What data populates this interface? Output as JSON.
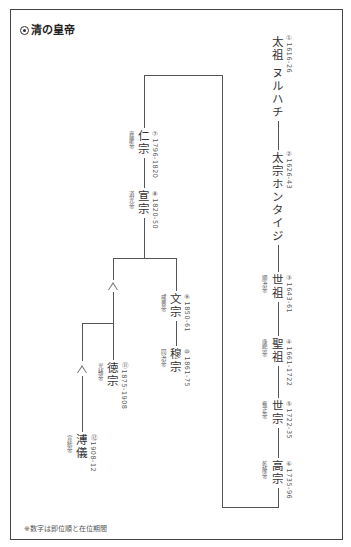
{
  "title": "清の皇帝",
  "note": "※数字は即位順と在位期間",
  "emperors": [
    {
      "order": "①",
      "name": "太祖 ヌルハチ",
      "reign": "1616-26",
      "era": ""
    },
    {
      "order": "②",
      "name": "太宗ホンタイジ",
      "reign": "1626-43",
      "era": ""
    },
    {
      "order": "③",
      "name": "世祖",
      "reign": "1643-61",
      "era": "順治帝"
    },
    {
      "order": "④",
      "name": "聖祖",
      "reign": "1661-1722",
      "era": "康熙帝"
    },
    {
      "order": "⑤",
      "name": "世宗",
      "reign": "1722-35",
      "era": "雍正帝"
    },
    {
      "order": "⑥",
      "name": "高宗",
      "reign": "1735-96",
      "era": "乾隆帝"
    },
    {
      "order": "⑦",
      "name": "仁宗",
      "reign": "1796-1820",
      "era": "嘉慶帝"
    },
    {
      "order": "⑧",
      "name": "宣宗",
      "reign": "1820-50",
      "era": "道光帝"
    },
    {
      "order": "⑨",
      "name": "文宗",
      "reign": "1850-61",
      "era": "咸豊帝"
    },
    {
      "order": "⑩",
      "name": "穆宗",
      "reign": "1861-75",
      "era": "同治帝"
    },
    {
      "order": "⑪",
      "name": "徳宗",
      "reign": "1875-1908",
      "era": "光緒帝"
    },
    {
      "order": "⑫",
      "name": "溥儀",
      "reign": "1908-12",
      "era": "宣統帝"
    }
  ],
  "labels": {
    "d1": "①1616-26",
    "d2": "②1626-43",
    "d3": "③1643-61",
    "d4": "④1661-1722",
    "d5": "⑤1722-35",
    "d6": "⑥1735-96",
    "d7": "⑦1796-1820",
    "d8": "⑧1820-50",
    "d9": "⑨1850-61",
    "d10": "⑩1861-75",
    "d11": "⑪1875-1908",
    "d12": "⑫1908-12"
  }
}
